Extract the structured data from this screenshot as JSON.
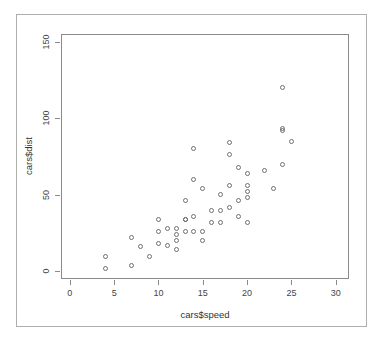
{
  "window": {
    "background_color": "#ffffff",
    "frame_color": "#aeaeae",
    "plot_box_color": "#8a8a8a"
  },
  "chart_data": {
    "type": "scatter",
    "title": "",
    "xlabel": "cars$speed",
    "ylabel": "cars$dist",
    "xlim": [
      -1,
      31.5
    ],
    "ylim": [
      -5,
      155
    ],
    "xticks": [
      0,
      5,
      10,
      15,
      20,
      25,
      30
    ],
    "yticks": [
      0,
      50,
      100,
      150
    ],
    "xtick_labels": [
      "0",
      "5",
      "10",
      "15",
      "20",
      "25",
      "30"
    ],
    "ytick_labels": [
      "0",
      "50",
      "100",
      "150"
    ],
    "grid": false,
    "legend": null,
    "marker": {
      "shape": "open-circle",
      "size_px": 5,
      "edge_color": "#6f6f6f",
      "fill": "none"
    },
    "n_points": 50,
    "series": [
      {
        "name": "cars",
        "x": [
          4,
          4,
          7,
          7,
          8,
          9,
          10,
          10,
          10,
          11,
          11,
          12,
          12,
          12,
          12,
          13,
          13,
          13,
          13,
          14,
          14,
          14,
          14,
          15,
          15,
          15,
          16,
          16,
          17,
          17,
          17,
          18,
          18,
          18,
          18,
          19,
          19,
          19,
          20,
          20,
          20,
          20,
          20,
          22,
          23,
          24,
          24,
          24,
          24,
          25
        ],
        "y": [
          2,
          10,
          4,
          22,
          16,
          10,
          18,
          26,
          34,
          17,
          28,
          14,
          20,
          24,
          28,
          26,
          34,
          34,
          46,
          26,
          36,
          60,
          80,
          20,
          26,
          54,
          32,
          40,
          32,
          40,
          50,
          42,
          56,
          76,
          84,
          36,
          46,
          68,
          32,
          48,
          52,
          56,
          64,
          66,
          54,
          70,
          92,
          93,
          120,
          85
        ]
      }
    ]
  }
}
